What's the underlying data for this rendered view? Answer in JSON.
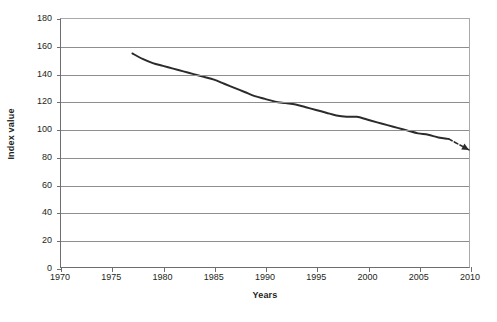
{
  "chart_data": {
    "type": "line",
    "title": "",
    "xlabel": "Years",
    "ylabel": "Index value",
    "xlim": [
      1970,
      2010
    ],
    "ylim": [
      0,
      180
    ],
    "grid": true,
    "legend": "none",
    "x_ticks": [
      1970,
      1975,
      1980,
      1985,
      1990,
      1995,
      2000,
      2005,
      2010
    ],
    "y_ticks": [
      0,
      20,
      40,
      60,
      80,
      100,
      120,
      140,
      160,
      180
    ],
    "series": [
      {
        "name": "Index value",
        "style": "solid",
        "color": "#2b2b2b",
        "x": [
          1977,
          1978,
          1979,
          1980,
          1981,
          1982,
          1983,
          1984,
          1985,
          1986,
          1987,
          1988,
          1989,
          1990,
          1991,
          1992,
          1993,
          1994,
          1995,
          1996,
          1997,
          1998,
          1999,
          2000,
          2001,
          2002,
          2003,
          2004,
          2005,
          2006,
          2007,
          2008
        ],
        "values": [
          155,
          151,
          148,
          146,
          144,
          142,
          140,
          138,
          136,
          133,
          130,
          127,
          124,
          122,
          120,
          119,
          118,
          116,
          114,
          112,
          110,
          109,
          109,
          107,
          105,
          103,
          101,
          99,
          97,
          96,
          94,
          93
        ]
      },
      {
        "name": "Projection",
        "style": "dashed",
        "color": "#2b2b2b",
        "arrow": true,
        "x": [
          2008,
          2010
        ],
        "values": [
          93,
          85
        ]
      }
    ],
    "annotations": [
      {
        "name": "projection-arrowhead",
        "x": 2010,
        "y": 85
      }
    ]
  }
}
